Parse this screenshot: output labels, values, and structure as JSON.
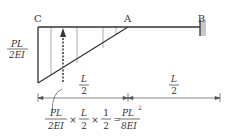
{
  "diagram": {
    "type": "cantilever-beam-moment-area",
    "points": {
      "C": "C",
      "A": "A",
      "B": "B"
    },
    "left_label": {
      "numerator": "PL",
      "denominator": "2EI"
    },
    "dimensions": [
      {
        "numerator": "L",
        "denominator": "2"
      },
      {
        "numerator": "L",
        "denominator": "2"
      }
    ],
    "formula": {
      "term1": {
        "numerator": "PL",
        "denominator": "2EI"
      },
      "times1": "×",
      "term2": {
        "numerator": "L",
        "denominator": "2"
      },
      "times2": "×",
      "term3": {
        "numerator": "1",
        "denominator": "2"
      },
      "equals": "=",
      "result": {
        "numerator": "PL",
        "superscript": "2",
        "denominator": "8EI"
      }
    },
    "colors": {
      "line": "#333333",
      "wall": "#bbbbbb"
    }
  }
}
